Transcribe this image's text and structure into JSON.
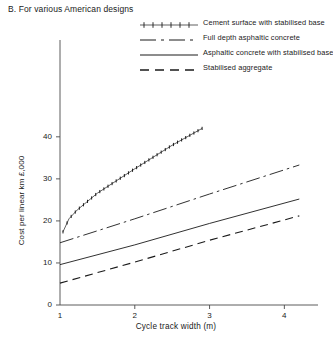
{
  "title": "B. For various American designs",
  "legend": {
    "position": "top-right",
    "items": [
      {
        "label": "Cement surface with stabilised base",
        "style": "dotted-cross",
        "icon": "legend-line-dotted"
      },
      {
        "label": "Full depth asphaltic concrete",
        "style": "dash-dot",
        "icon": "legend-line-dash-dot"
      },
      {
        "label": "Asphaltic concrete with stabilised base",
        "style": "solid",
        "icon": "legend-line-solid"
      },
      {
        "label": "Stabilised aggregate",
        "style": "dashed",
        "icon": "legend-line-dashed"
      }
    ]
  },
  "axes": {
    "x": {
      "label": "Cycle track width (m)",
      "ticks": [
        1,
        2,
        3,
        4
      ],
      "min": 1,
      "max": 4.45
    },
    "y": {
      "label": "Cost per linear km £,000",
      "ticks": [
        0,
        10,
        20,
        30,
        40
      ],
      "min": 0,
      "max": 44
    }
  },
  "chart_data": {
    "type": "line",
    "title": "B. For various American designs",
    "xlabel": "Cycle track width (m)",
    "ylabel": "Cost per linear km £,000",
    "xlim": [
      1,
      4.45
    ],
    "ylim": [
      0,
      44
    ],
    "xticks": [
      1,
      2,
      3,
      4
    ],
    "yticks": [
      0,
      10,
      20,
      30,
      40
    ],
    "grid": false,
    "legend_position": "top-right",
    "series": [
      {
        "name": "Cement surface with stabilised base",
        "style": "dotted-cross",
        "x": [
          1.04,
          1.12,
          1.23,
          1.5,
          2.0,
          2.5,
          2.9
        ],
        "y": [
          17.4,
          20.5,
          22.6,
          26.6,
          32.4,
          38.0,
          42.0
        ]
      },
      {
        "name": "Full depth asphaltic concrete",
        "style": "dash-dot",
        "x": [
          1.0,
          2.0,
          3.0,
          4.2
        ],
        "y": [
          14.8,
          20.5,
          26.4,
          33.3
        ]
      },
      {
        "name": "Asphaltic concrete with stabilised base",
        "style": "solid",
        "x": [
          1.0,
          2.0,
          3.0,
          4.2
        ],
        "y": [
          9.6,
          14.3,
          19.4,
          25.2
        ]
      },
      {
        "name": "Stabilised aggregate",
        "style": "dashed",
        "x": [
          1.0,
          2.0,
          3.0,
          4.2
        ],
        "y": [
          5.2,
          10.2,
          15.4,
          21.2
        ]
      }
    ]
  }
}
